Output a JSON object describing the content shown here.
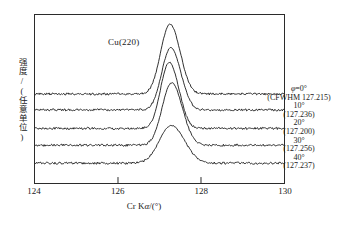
{
  "chart_data": {
    "type": "line",
    "title": "",
    "peak_label": "Cu(220)",
    "xlabel": "Cr Kα/(°)",
    "ylabel": "强度/(任意单位)",
    "xlim": [
      124,
      130
    ],
    "xticks": [
      124,
      126,
      128,
      130
    ],
    "xtick_labels": [
      "124",
      "126",
      "128",
      "130"
    ],
    "ylim": [
      0,
      1
    ],
    "yticks": [],
    "grid": false,
    "legend_position": "right",
    "series": [
      {
        "name": "φ=0°",
        "angle_label": "φ=0°",
        "value_label": "(CFWHM 127.215)",
        "peak_center": 127.215,
        "baseline": 0.53,
        "amplitude": 0.37,
        "width": 0.48,
        "x": [
          124.0,
          124.3,
          124.6,
          124.9,
          125.2,
          125.5,
          125.8,
          126.1,
          126.4,
          126.7,
          127.0,
          127.215,
          127.45,
          127.7,
          128.0,
          128.3,
          128.6,
          128.9,
          129.2,
          129.5,
          129.8,
          130.0
        ],
        "y": [
          0.535,
          0.532,
          0.538,
          0.531,
          0.536,
          0.533,
          0.54,
          0.545,
          0.57,
          0.665,
          0.835,
          0.9,
          0.862,
          0.76,
          0.625,
          0.565,
          0.545,
          0.538,
          0.54,
          0.534,
          0.537,
          0.533
        ]
      },
      {
        "name": "10°",
        "angle_label": "10°",
        "value_label": "(127.236)",
        "peak_center": 127.236,
        "baseline": 0.435,
        "amplitude": 0.33,
        "width": 0.47,
        "x": [
          124.0,
          124.3,
          124.6,
          124.9,
          125.2,
          125.5,
          125.8,
          126.1,
          126.4,
          126.7,
          127.0,
          127.236,
          127.45,
          127.7,
          128.0,
          128.3,
          128.6,
          128.9,
          129.2,
          129.5,
          129.8,
          130.0
        ],
        "y": [
          0.437,
          0.433,
          0.44,
          0.434,
          0.438,
          0.435,
          0.442,
          0.448,
          0.472,
          0.56,
          0.718,
          0.775,
          0.742,
          0.65,
          0.525,
          0.465,
          0.448,
          0.44,
          0.443,
          0.436,
          0.439,
          0.435
        ]
      },
      {
        "name": "20°",
        "angle_label": "20°",
        "value_label": "(127.200)",
        "peak_center": 127.2,
        "baseline": 0.325,
        "amplitude": 0.35,
        "width": 0.45,
        "x": [
          124.0,
          124.3,
          124.6,
          124.9,
          125.2,
          125.5,
          125.8,
          126.1,
          126.4,
          126.7,
          127.0,
          127.2,
          127.45,
          127.7,
          128.0,
          128.3,
          128.6,
          128.9,
          129.2,
          129.5,
          129.8,
          130.0
        ],
        "y": [
          0.327,
          0.323,
          0.33,
          0.324,
          0.328,
          0.325,
          0.332,
          0.34,
          0.368,
          0.47,
          0.64,
          0.69,
          0.645,
          0.54,
          0.418,
          0.358,
          0.34,
          0.331,
          0.334,
          0.327,
          0.33,
          0.326
        ]
      },
      {
        "name": "30°",
        "angle_label": "30°",
        "value_label": "(127.256)",
        "peak_center": 127.256,
        "baseline": 0.225,
        "amplitude": 0.33,
        "width": 0.5,
        "x": [
          124.0,
          124.3,
          124.6,
          124.9,
          125.2,
          125.5,
          125.8,
          126.1,
          126.4,
          126.7,
          127.0,
          127.256,
          127.45,
          127.7,
          128.0,
          128.3,
          128.6,
          128.9,
          129.2,
          129.5,
          129.8,
          130.0
        ],
        "y": [
          0.227,
          0.223,
          0.23,
          0.224,
          0.228,
          0.226,
          0.233,
          0.242,
          0.272,
          0.372,
          0.52,
          0.57,
          0.54,
          0.45,
          0.33,
          0.262,
          0.244,
          0.234,
          0.236,
          0.229,
          0.232,
          0.228
        ]
      },
      {
        "name": "40°",
        "angle_label": "40°",
        "value_label": "(127.237)",
        "peak_center": 127.237,
        "baseline": 0.118,
        "amplitude": 0.2,
        "width": 0.62,
        "x": [
          124.0,
          124.3,
          124.6,
          124.9,
          125.2,
          125.5,
          125.8,
          126.1,
          126.4,
          126.7,
          127.0,
          127.237,
          127.45,
          127.7,
          128.0,
          128.3,
          128.6,
          128.9,
          129.2,
          129.5,
          129.8,
          130.0
        ],
        "y": [
          0.12,
          0.116,
          0.123,
          0.117,
          0.121,
          0.119,
          0.126,
          0.138,
          0.168,
          0.235,
          0.312,
          0.33,
          0.318,
          0.272,
          0.2,
          0.152,
          0.133,
          0.125,
          0.127,
          0.121,
          0.124,
          0.12
        ]
      }
    ],
    "annotations": [
      {
        "angle": "φ=0°",
        "value": "(CFWHM 127.215)"
      },
      {
        "angle": "10°",
        "value": "(127.236)"
      },
      {
        "angle": "20°",
        "value": "(127.200)"
      },
      {
        "angle": "30°",
        "value": "(127.256)"
      },
      {
        "angle": "40°",
        "value": "(127.237)"
      }
    ],
    "line_color": "#1a1a1a",
    "axis_color": "#2b2b2b",
    "background_color": "#ffffff"
  },
  "axis": {
    "x_title_prefix": "Cr K",
    "x_title_symbol": "α",
    "x_title_suffix": "/(°)",
    "y_title": "强度/(任意单位)",
    "tick_124": "124",
    "tick_126": "126",
    "tick_128": "128",
    "tick_130": "130"
  },
  "labels": {
    "peak": "Cu(220)"
  }
}
